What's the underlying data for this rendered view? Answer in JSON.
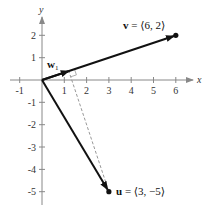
{
  "diagram": {
    "type": "vector-projection",
    "axes": {
      "x_label": "x",
      "y_label": "y",
      "x_ticks": [
        "-1",
        "1",
        "2",
        "3",
        "4",
        "5",
        "6"
      ],
      "y_ticks": [
        "2",
        "1",
        "-1",
        "-2",
        "-3",
        "-4",
        "-5"
      ]
    },
    "vectors": {
      "v": {
        "name": "v",
        "label_eq": " = ⟨6, 2⟩",
        "components": [
          6,
          2
        ]
      },
      "u": {
        "name": "u",
        "label_eq": " = ⟨3, −5⟩",
        "components": [
          3,
          -5
        ]
      },
      "w1": {
        "name": "w",
        "subscript": "1",
        "components": [
          1.2,
          0.4
        ]
      }
    },
    "colors": {
      "axis": "#888888",
      "vector": "#111111",
      "dashed": "#999999"
    }
  }
}
